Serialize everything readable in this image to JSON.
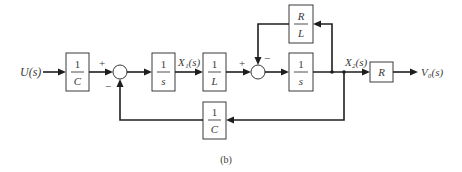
{
  "diagram": {
    "type": "block-diagram",
    "caption": "(b)",
    "signals": {
      "input": "U(s)",
      "x1": "X₁(s)",
      "x2": "X₂(s)",
      "output": "V₀(s)"
    },
    "blocks": [
      {
        "id": "b1",
        "num": "1",
        "den": "C"
      },
      {
        "id": "b2",
        "num": "1",
        "den": "s"
      },
      {
        "id": "b3",
        "num": "1",
        "den": "L"
      },
      {
        "id": "b4",
        "num": "R",
        "den": "L"
      },
      {
        "id": "b5",
        "num": "1",
        "den": "s"
      },
      {
        "id": "b6",
        "label": "R"
      },
      {
        "id": "b7",
        "num": "1",
        "den": "C"
      }
    ],
    "summing_junctions": [
      {
        "id": "sum1",
        "signs": {
          "top": "+",
          "bottom": "−"
        }
      },
      {
        "id": "sum2",
        "signs": {
          "left": "+",
          "top": "−"
        }
      }
    ],
    "colors": {
      "line": "#1e1e1e",
      "text": "#3a3a3a",
      "background": "#ffffff"
    }
  }
}
